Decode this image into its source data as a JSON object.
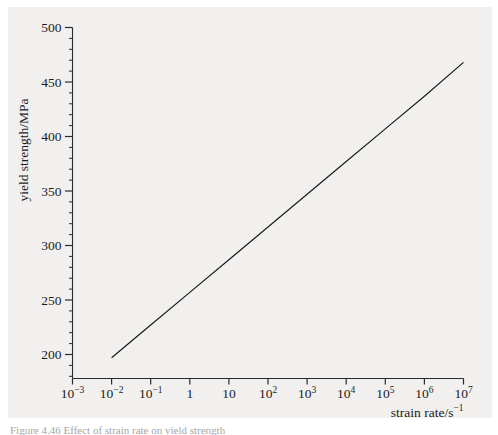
{
  "figure": {
    "background_color": "#f1f0ee",
    "page_color": "#ffffff",
    "line_color": "#1c1c1c",
    "axis_color": "#2a2a2a",
    "caption_text": "Figure 4.46 Effect of strain rate on yield strength"
  },
  "chart_data": {
    "type": "line",
    "title": "",
    "xlabel": "strain rate/s",
    "xlabel_exponent": "−1",
    "ylabel": "yield strength/MPa",
    "x_scale": "log",
    "y_scale": "linear",
    "xlim": [
      0.001,
      10000000
    ],
    "ylim": [
      170,
      500
    ],
    "grid": false,
    "legend": null,
    "x_tick_labels": [
      {
        "base": "10",
        "exp": "−3",
        "value": 0.001
      },
      {
        "base": "10",
        "exp": "−2",
        "value": 0.01
      },
      {
        "base": "10",
        "exp": "−1",
        "value": 0.1
      },
      {
        "base": "1",
        "exp": "",
        "value": 1
      },
      {
        "base": "10",
        "exp": "",
        "value": 10
      },
      {
        "base": "10",
        "exp": "2",
        "value": 100
      },
      {
        "base": "10",
        "exp": "3",
        "value": 1000
      },
      {
        "base": "10",
        "exp": "4",
        "value": 10000
      },
      {
        "base": "10",
        "exp": "5",
        "value": 100000
      },
      {
        "base": "10",
        "exp": "6",
        "value": 1000000
      },
      {
        "base": "10",
        "exp": "7",
        "value": 10000000
      }
    ],
    "y_major_ticks": [
      200,
      250,
      300,
      350,
      400,
      450,
      500
    ],
    "y_minor_tick_step": 10,
    "y_axis_min_tick": 180,
    "series": [
      {
        "name": "yield strength vs strain rate",
        "x": [
          0.01,
          0.1,
          1,
          10,
          100,
          1000,
          10000,
          100000,
          1000000,
          10000000
        ],
        "y": [
          197,
          227,
          257,
          287,
          317,
          347,
          377,
          407,
          437,
          468
        ]
      }
    ]
  }
}
